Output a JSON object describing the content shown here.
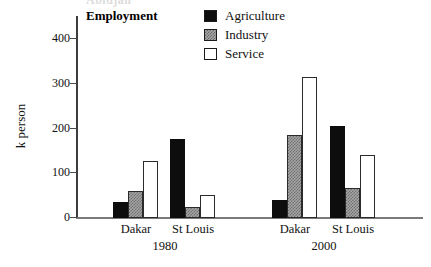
{
  "clipped_header": "Abidjan",
  "plot_title": "Employment",
  "axis": {
    "y_title": "k person",
    "y_ticks": [
      "0",
      "100",
      "200",
      "300",
      "400"
    ]
  },
  "legend": {
    "items": [
      {
        "label": "Agriculture",
        "swatch": "solid-black-swatch",
        "color": "#0d0d0d"
      },
      {
        "label": "Industry",
        "swatch": "hatched-gray-swatch",
        "color": "#a6a6a6"
      },
      {
        "label": "Service",
        "swatch": "outlined-white-swatch",
        "color": "#ffffff"
      }
    ]
  },
  "x_axis": {
    "city_labels": [
      "Dakar",
      "St Louis",
      "Dakar",
      "St Louis"
    ],
    "group_labels": [
      "1980",
      "2000"
    ]
  },
  "chart_data": {
    "type": "bar",
    "title": "Employment",
    "xlabel": "",
    "ylabel": "k person",
    "ylim": [
      0,
      450
    ],
    "yticks": [
      0,
      100,
      200,
      300,
      400
    ],
    "grid": false,
    "legend_position": "top-center",
    "categories": [
      "Dakar 1980",
      "St Louis 1980",
      "Dakar 2000",
      "St Louis 2000"
    ],
    "groups": [
      {
        "name": "1980",
        "categories": [
          "Dakar",
          "St Louis"
        ]
      },
      {
        "name": "2000",
        "categories": [
          "Dakar",
          "St Louis"
        ]
      }
    ],
    "series": [
      {
        "name": "Agriculture",
        "color": "#0d0d0d",
        "values": [
          35,
          177,
          40,
          207
        ]
      },
      {
        "name": "Industry",
        "color": "#a6a6a6",
        "values": [
          60,
          25,
          185,
          67
        ]
      },
      {
        "name": "Service",
        "color": "#ffffff",
        "values": [
          127,
          52,
          315,
          140
        ]
      }
    ]
  }
}
